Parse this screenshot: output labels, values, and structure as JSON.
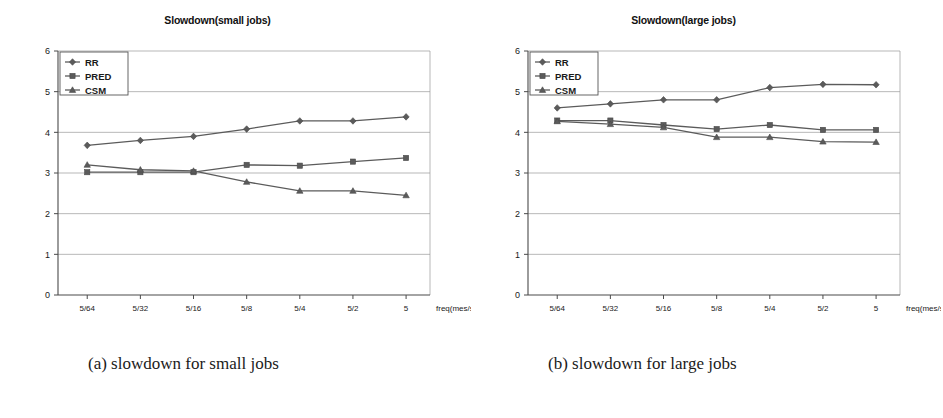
{
  "figure": {
    "captions": [
      {
        "id": "a",
        "text": "(a) slowdown for small jobs"
      },
      {
        "id": "b",
        "text": "(b) slowdown for large jobs"
      }
    ]
  },
  "panels": [
    {
      "key": "small",
      "title": "Slowdown(small jobs)"
    },
    {
      "key": "large",
      "title": "Slowdown(large jobs)"
    }
  ],
  "legend": {
    "entries": [
      {
        "label": "RR",
        "marker": "diamond-marker"
      },
      {
        "label": "PRED",
        "marker": "square-marker"
      },
      {
        "label": "CSM",
        "marker": "triangle-marker"
      }
    ]
  },
  "axis": {
    "x_caption": "freq(mes/s)",
    "x_ticks": [
      "5/64",
      "5/32",
      "5/16",
      "5/8",
      "5/4",
      "5/2",
      "5"
    ],
    "y_ticks": [
      "0",
      "1",
      "2",
      "3",
      "4",
      "5",
      "6"
    ]
  },
  "colors": {
    "line": "#5b5b5b",
    "grid": "#9a9a9a",
    "axis": "#4a4a4a",
    "text": "#1a1a1a",
    "background": "#ffffff"
  },
  "chart_data": [
    {
      "type": "line",
      "title": "Slowdown(small jobs)",
      "subtitle": "(a) slowdown for small jobs",
      "xlabel": "freq(mes/s)",
      "ylabel": "",
      "categories": [
        "5/64",
        "5/32",
        "5/16",
        "5/8",
        "5/4",
        "5/2",
        "5"
      ],
      "ylim": [
        0,
        6
      ],
      "yticks": [
        0,
        1,
        2,
        3,
        4,
        5,
        6
      ],
      "grid": true,
      "legend_position": "top-left",
      "series": [
        {
          "name": "RR",
          "marker": "diamond",
          "values": [
            3.68,
            3.8,
            3.9,
            4.08,
            4.28,
            4.28,
            4.38
          ]
        },
        {
          "name": "PRED",
          "marker": "square",
          "values": [
            3.02,
            3.02,
            3.02,
            3.2,
            3.18,
            3.28,
            3.37
          ]
        },
        {
          "name": "CSM",
          "marker": "triangle",
          "values": [
            3.2,
            3.08,
            3.05,
            2.78,
            2.56,
            2.56,
            2.45
          ]
        }
      ]
    },
    {
      "type": "line",
      "title": "Slowdown(large jobs)",
      "subtitle": "(b) slowdown for large jobs",
      "xlabel": "freq(mes/s)",
      "ylabel": "",
      "categories": [
        "5/64",
        "5/32",
        "5/16",
        "5/8",
        "5/4",
        "5/2",
        "5"
      ],
      "ylim": [
        0,
        6
      ],
      "yticks": [
        0,
        1,
        2,
        3,
        4,
        5,
        6
      ],
      "grid": true,
      "legend_position": "top-left",
      "series": [
        {
          "name": "RR",
          "marker": "diamond",
          "values": [
            4.6,
            4.7,
            4.8,
            4.8,
            5.1,
            5.18,
            5.17
          ]
        },
        {
          "name": "PRED",
          "marker": "square",
          "values": [
            4.29,
            4.29,
            4.18,
            4.08,
            4.18,
            4.06,
            4.06
          ]
        },
        {
          "name": "CSM",
          "marker": "triangle",
          "values": [
            4.27,
            4.2,
            4.12,
            3.88,
            3.88,
            3.77,
            3.76
          ]
        }
      ]
    }
  ]
}
